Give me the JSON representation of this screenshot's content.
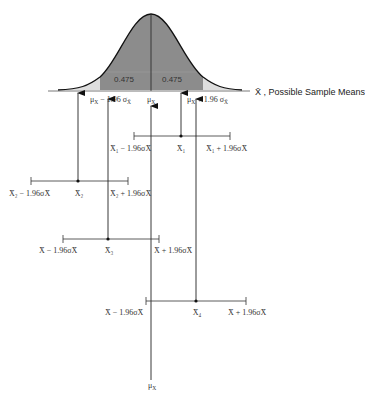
{
  "distribution": {
    "area_left": "0.475",
    "area_right": "0.475",
    "lower_bound_label": "μX − 1.96σX̄",
    "mean_label": "μX",
    "upper_bound_label": "μX + 1.96σX̄",
    "axis_title": "X̄ , Possible Sample Means",
    "colors": {
      "center_shade": "#8c8c8c",
      "tail_shade": "#dedede",
      "curve": "#111111"
    }
  },
  "intervals": [
    {
      "id": "x1",
      "mean_label": "X̄₁",
      "lower_label": "X̄₁ − 1.96σX̄",
      "upper_label": "X̄₁ + 1.96σX̄",
      "contains_mu": true
    },
    {
      "id": "x2",
      "mean_label": "X̄₂",
      "lower_label": "X̄₂ − 1.96σX̄",
      "upper_label": "X̄₂ + 1.96σX̄",
      "contains_mu": false
    },
    {
      "id": "x3",
      "mean_label": "X̄₃",
      "lower_label": "X̄ − 1.96σX̄",
      "upper_label": "X̄ + 1.96σX̄",
      "contains_mu": true
    },
    {
      "id": "x4",
      "mean_label": "X̄₄",
      "lower_label": "X̄ − 1.96σX̄",
      "upper_label": "X̄ + 1.96σX̄",
      "contains_mu": true
    }
  ],
  "bottom_label": "μX"
}
